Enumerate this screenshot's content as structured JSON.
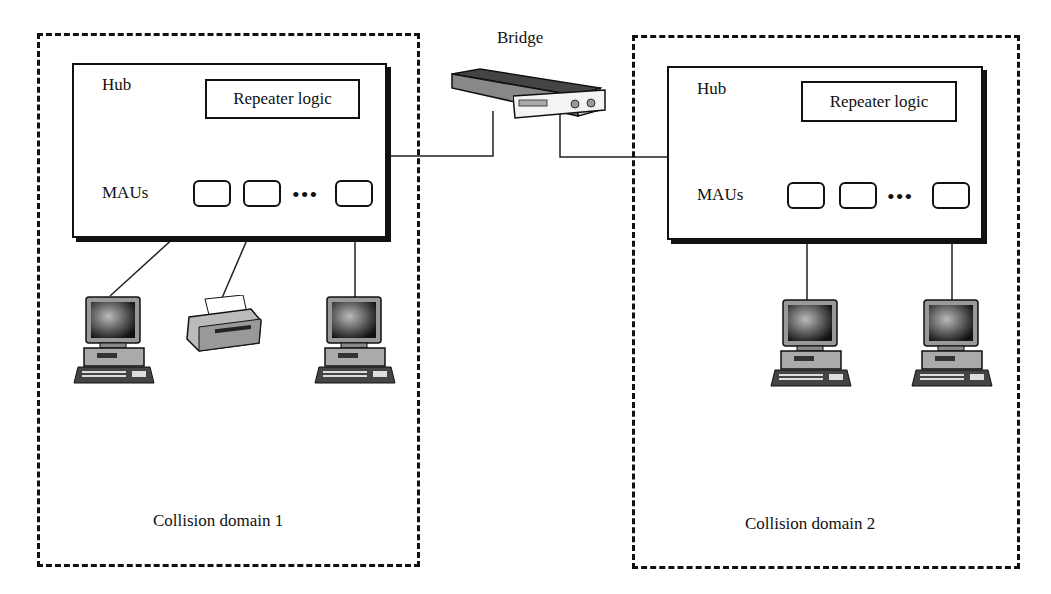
{
  "bridge": {
    "label": "Bridge",
    "icon": "bridge-device-icon"
  },
  "domains": [
    {
      "label": "Collision domain 1",
      "hub": {
        "label": "Hub",
        "repeater_label": "Repeater logic",
        "maus_label": "MAUs",
        "ellipsis": "•••"
      },
      "devices": [
        "computer",
        "printer",
        "computer"
      ]
    },
    {
      "label": "Collision domain 2",
      "hub": {
        "label": "Hub",
        "repeater_label": "Repeater logic",
        "maus_label": "MAUs",
        "ellipsis": "•••"
      },
      "devices": [
        "computer",
        "computer"
      ]
    }
  ]
}
